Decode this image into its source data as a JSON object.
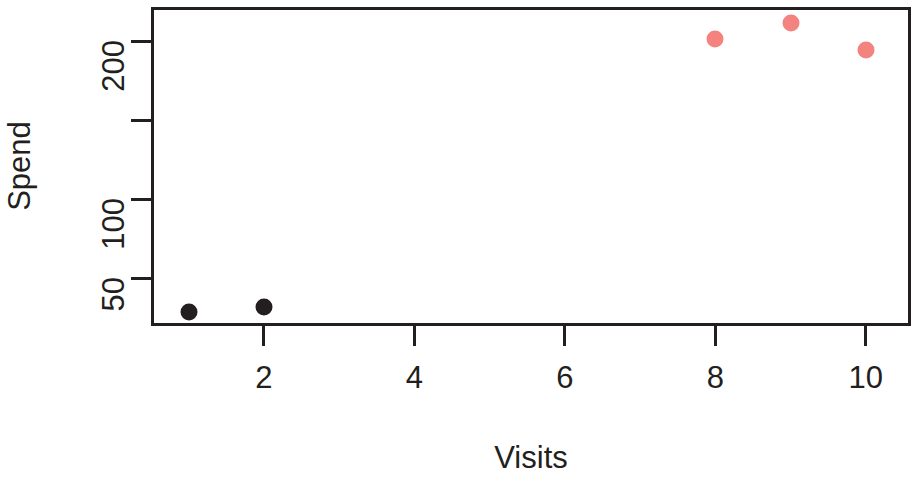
{
  "chart_data": {
    "type": "scatter",
    "title": "",
    "xlabel": "Visits",
    "ylabel": "Spend",
    "xlim": [
      0.5,
      10.6
    ],
    "ylim": [
      20,
      222
    ],
    "grid": false,
    "legend": "none",
    "x_ticks": [
      {
        "value": 2,
        "label": "2"
      },
      {
        "value": 4,
        "label": "4"
      },
      {
        "value": 6,
        "label": "6"
      },
      {
        "value": 8,
        "label": "8"
      },
      {
        "value": 10,
        "label": "10"
      }
    ],
    "y_ticks": [
      {
        "value": 50,
        "label": "50"
      },
      {
        "value": 100,
        "label": "100"
      },
      {
        "value": 150,
        "label": ""
      },
      {
        "value": 200,
        "label": "200"
      }
    ],
    "series": [
      {
        "name": "group-a",
        "color": "#231f20",
        "point_size": 17,
        "x": [
          1,
          2
        ],
        "y": [
          29,
          32
        ]
      },
      {
        "name": "group-b",
        "color": "#f4827f",
        "point_size": 17,
        "x": [
          8,
          9,
          10
        ],
        "y": [
          202,
          212,
          195
        ]
      }
    ]
  },
  "axes": {
    "x_title": "Visits",
    "y_title": "Spend"
  },
  "colors": {
    "axis": "#231f20",
    "group_a": "#231f20",
    "group_b": "#f4827f",
    "background": "#ffffff"
  }
}
